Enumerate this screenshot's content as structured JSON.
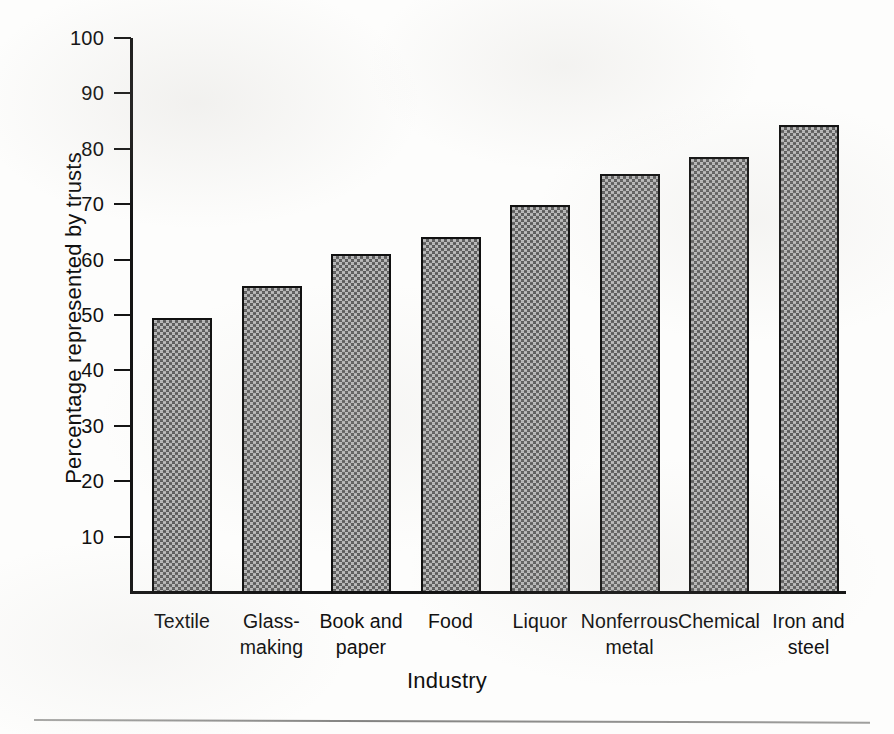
{
  "chart_data": {
    "type": "bar",
    "title": "",
    "subtitle": "",
    "xlabel": "Industry",
    "ylabel": "Percentage represented by trusts",
    "categories": [
      "Textile",
      "Glass-making",
      "Book and paper",
      "Food",
      "Liquor",
      "Nonferrous metal",
      "Chemical",
      "Iron and steel"
    ],
    "category_lines": [
      [
        "Textile"
      ],
      [
        "Glass-",
        "making"
      ],
      [
        "Book and",
        "paper"
      ],
      [
        "Food"
      ],
      [
        "Liquor"
      ],
      [
        "Nonferrous",
        "metal"
      ],
      [
        "Chemical"
      ],
      [
        "Iron and",
        "steel"
      ]
    ],
    "values": [
      49.5,
      55.3,
      61.0,
      64.0,
      69.8,
      75.5,
      78.5,
      84.3
    ],
    "ylim": [
      0,
      100
    ],
    "yticks": [
      10,
      20,
      30,
      40,
      50,
      60,
      70,
      80,
      90,
      100
    ],
    "ytick_labels": [
      "10",
      "20",
      "30",
      "40",
      "50",
      "60",
      "70",
      "80",
      "90",
      "100"
    ],
    "grid": false,
    "legend": false,
    "legend_position": "none",
    "bar_fill": "#808080",
    "bar_edge": "#111111",
    "axis_color": "#141414"
  }
}
